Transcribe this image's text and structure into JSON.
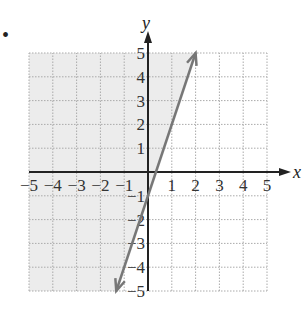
{
  "chart_data": {
    "type": "line",
    "title": "",
    "xlabel": "x",
    "ylabel": "y",
    "xlim": [
      -5,
      5
    ],
    "ylim": [
      -5,
      5
    ],
    "grid": true,
    "x_ticks": [
      -5,
      -4,
      -3,
      -2,
      -1,
      1,
      2,
      3,
      4,
      5
    ],
    "y_ticks": [
      5,
      4,
      3,
      2,
      1,
      -1,
      -2,
      -3,
      -4,
      -5
    ],
    "x_tick_labels": [
      "−5",
      "−4",
      "−3",
      "−2",
      "−1",
      "1",
      "2",
      "3",
      "4",
      "5"
    ],
    "y_tick_labels": [
      "5",
      "4",
      "3",
      "2",
      "1",
      "−1",
      "−2",
      "−3",
      "−4",
      "−5"
    ],
    "series": [
      {
        "name": "boundary line y = 3x − 1",
        "equation": "y = 3x - 1",
        "style": "solid, arrows both ends",
        "points": [
          [
            -1.333,
            -5
          ],
          [
            2,
            5
          ]
        ]
      }
    ],
    "shaded_region": "left of / above the line (y > 3x − 1)",
    "colors": {
      "line": "#777777",
      "shade": "#ececec",
      "grid": "#aaaaaa",
      "axes": "#222222"
    }
  },
  "bullet": "•"
}
